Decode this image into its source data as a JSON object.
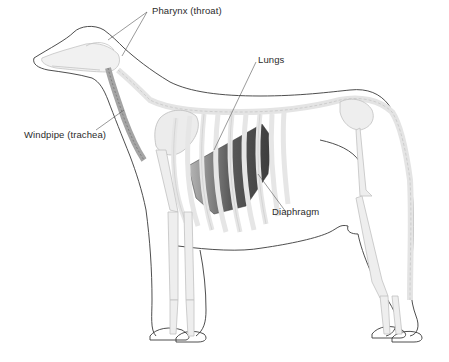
{
  "diagram": {
    "labels": {
      "pharynx": "Pharynx (throat)",
      "lungs": "Lungs",
      "windpipe": "Windpipe (trachea)",
      "diaphragm": "Diaphragm"
    },
    "colors": {
      "outline": "#3a3a3a",
      "bone_fill": "#efefef",
      "bone_stroke": "#c6c6c6",
      "lung_dark": "#4a4a4a",
      "lung_mid": "#8a8a8a",
      "trachea": "#9a9a9a",
      "leader_line": "#555555",
      "label_text": "#2b2b2b"
    }
  }
}
